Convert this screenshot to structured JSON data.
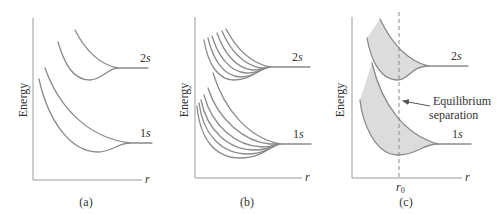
{
  "figure": {
    "panels": [
      {
        "id": "a",
        "caption": "(a)",
        "y_axis_label": "Energy",
        "x_axis_label": "r",
        "levels": [
          {
            "label_num": "2",
            "label_var": "s"
          },
          {
            "label_num": "1",
            "label_var": "s"
          }
        ],
        "curves_per_level": 2
      },
      {
        "id": "b",
        "caption": "(b)",
        "y_axis_label": "Energy",
        "x_axis_label": "r",
        "levels": [
          {
            "label_num": "2",
            "label_var": "s"
          },
          {
            "label_num": "1",
            "label_var": "s"
          }
        ],
        "curves_per_level": 6
      },
      {
        "id": "c",
        "caption": "(c)",
        "y_axis_label": "Energy",
        "x_axis_label": "r",
        "levels": [
          {
            "label_num": "2",
            "label_var": "s"
          },
          {
            "label_num": "1",
            "label_var": "s"
          }
        ],
        "equilibrium_marker": "r",
        "equilibrium_marker_sub": "0",
        "annotation_line1": "Equilibrium",
        "annotation_line2": "separation",
        "band_fill_color": "#dcdcdc"
      }
    ],
    "curve_color": "#8a8a8a",
    "axis_color": "#9a9a9a"
  }
}
